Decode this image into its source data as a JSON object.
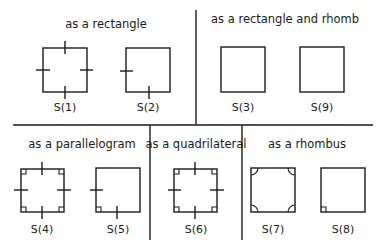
{
  "panels": [
    {
      "id": "rectangle",
      "title": "as a rectangle",
      "items": [
        "S(1)",
        "S(2)"
      ]
    },
    {
      "id": "rect-rhomb",
      "title": "as a rectangle and rhomb",
      "items": [
        "S(3)",
        "S(9)"
      ]
    },
    {
      "id": "parallelogram",
      "title": "as a parallelogram",
      "items": [
        "S(4)",
        "S(5)"
      ]
    },
    {
      "id": "quadrilateral",
      "title": "as a quadrilateral",
      "items": [
        "S(6)"
      ]
    },
    {
      "id": "rhombus",
      "title": "as a rhombus",
      "items": [
        "S(7)",
        "S(8)"
      ]
    }
  ],
  "colors": {
    "stroke": "#1a1a1a",
    "background": "#ffffff"
  }
}
